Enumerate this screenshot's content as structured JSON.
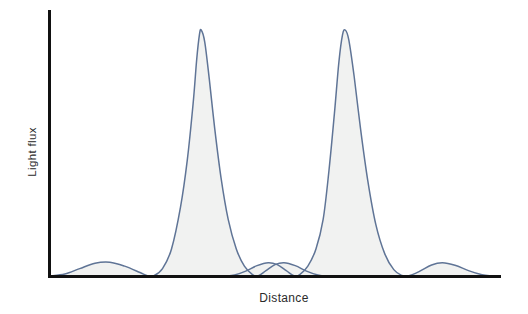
{
  "figure": {
    "title": "",
    "background_color": "#ffffff",
    "width": 528,
    "height": 314
  },
  "axes": {
    "y_axis_label": "Light flux",
    "x_axis_label": "Distance",
    "axis_color": "#111111",
    "y_axis_name": "y-axis",
    "x_axis_name": "x-axis"
  },
  "style": {
    "curve_stroke_color": "#5f7496",
    "curve_fill_color": "#f1f2f1",
    "label_color": "#2b2b2b"
  },
  "chart_data": {
    "type": "line",
    "title": "",
    "subtitle": "",
    "xlabel": "Distance",
    "ylabel": "Light flux",
    "grid": false,
    "legend": null,
    "legend_position": "none",
    "tick_labels_x": [],
    "tick_labels_y": [],
    "xlim": [
      0,
      1
    ],
    "ylim": [
      0,
      1
    ],
    "series": [
      {
        "name": "Airy pattern 1",
        "peak_center_x": 0.33,
        "peak_height": 1.0,
        "points": [
          {
            "x": 0.0,
            "y": 0.0
          },
          {
            "x": 0.033,
            "y": 0.008
          },
          {
            "x": 0.066,
            "y": 0.03
          },
          {
            "x": 0.1,
            "y": 0.052
          },
          {
            "x": 0.133,
            "y": 0.056
          },
          {
            "x": 0.166,
            "y": 0.04
          },
          {
            "x": 0.2,
            "y": 0.014
          },
          {
            "x": 0.215,
            "y": 0.002
          },
          {
            "x": 0.23,
            "y": 0.0
          },
          {
            "x": 0.25,
            "y": 0.03
          },
          {
            "x": 0.27,
            "y": 0.11
          },
          {
            "x": 0.29,
            "y": 0.28
          },
          {
            "x": 0.305,
            "y": 0.47
          },
          {
            "x": 0.318,
            "y": 0.7
          },
          {
            "x": 0.326,
            "y": 0.88
          },
          {
            "x": 0.332,
            "y": 0.98
          },
          {
            "x": 0.336,
            "y": 1.0
          },
          {
            "x": 0.344,
            "y": 0.95
          },
          {
            "x": 0.354,
            "y": 0.8
          },
          {
            "x": 0.366,
            "y": 0.6
          },
          {
            "x": 0.38,
            "y": 0.4
          },
          {
            "x": 0.396,
            "y": 0.23
          },
          {
            "x": 0.414,
            "y": 0.11
          },
          {
            "x": 0.432,
            "y": 0.04
          },
          {
            "x": 0.45,
            "y": 0.006
          },
          {
            "x": 0.462,
            "y": 0.0
          },
          {
            "x": 0.48,
            "y": 0.022
          },
          {
            "x": 0.5,
            "y": 0.046
          },
          {
            "x": 0.52,
            "y": 0.054
          },
          {
            "x": 0.545,
            "y": 0.042
          },
          {
            "x": 0.57,
            "y": 0.02
          },
          {
            "x": 0.595,
            "y": 0.004
          },
          {
            "x": 0.61,
            "y": 0.0
          }
        ]
      },
      {
        "name": "Airy pattern 2",
        "peak_center_x": 0.624,
        "peak_height": 1.0,
        "points": [
          {
            "x": 0.39,
            "y": 0.0
          },
          {
            "x": 0.41,
            "y": 0.004
          },
          {
            "x": 0.435,
            "y": 0.02
          },
          {
            "x": 0.46,
            "y": 0.042
          },
          {
            "x": 0.485,
            "y": 0.054
          },
          {
            "x": 0.505,
            "y": 0.046
          },
          {
            "x": 0.525,
            "y": 0.022
          },
          {
            "x": 0.543,
            "y": 0.0
          },
          {
            "x": 0.555,
            "y": 0.006
          },
          {
            "x": 0.573,
            "y": 0.04
          },
          {
            "x": 0.591,
            "y": 0.11
          },
          {
            "x": 0.607,
            "y": 0.23
          },
          {
            "x": 0.62,
            "y": 0.43
          },
          {
            "x": 0.632,
            "y": 0.66
          },
          {
            "x": 0.642,
            "y": 0.87
          },
          {
            "x": 0.65,
            "y": 0.98
          },
          {
            "x": 0.656,
            "y": 1.0
          },
          {
            "x": 0.664,
            "y": 0.96
          },
          {
            "x": 0.676,
            "y": 0.81
          },
          {
            "x": 0.69,
            "y": 0.6
          },
          {
            "x": 0.706,
            "y": 0.39
          },
          {
            "x": 0.724,
            "y": 0.21
          },
          {
            "x": 0.744,
            "y": 0.09
          },
          {
            "x": 0.764,
            "y": 0.026
          },
          {
            "x": 0.782,
            "y": 0.002
          },
          {
            "x": 0.795,
            "y": 0.0
          },
          {
            "x": 0.82,
            "y": 0.018
          },
          {
            "x": 0.848,
            "y": 0.045
          },
          {
            "x": 0.872,
            "y": 0.054
          },
          {
            "x": 0.9,
            "y": 0.044
          },
          {
            "x": 0.93,
            "y": 0.022
          },
          {
            "x": 0.96,
            "y": 0.005
          },
          {
            "x": 0.98,
            "y": 0.0
          }
        ]
      }
    ]
  }
}
